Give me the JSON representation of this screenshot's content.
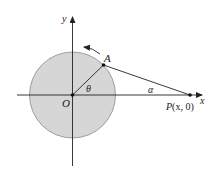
{
  "diagram": {
    "type": "geometry",
    "colors": {
      "circle_fill": "#d6d6d6",
      "circle_stroke": "#8a8a8a",
      "line": "#222222",
      "background": "#ffffff"
    },
    "axes": {
      "x_label": "x",
      "y_label": "y"
    },
    "points": {
      "origin": {
        "label": "O"
      },
      "a": {
        "label": "A"
      },
      "p": {
        "label_name": "P",
        "label_coords": "(x, 0)"
      }
    },
    "angles": {
      "theta": "θ",
      "alpha": "α"
    },
    "rotation_arrow": {
      "direction": "counterclockwise"
    }
  }
}
